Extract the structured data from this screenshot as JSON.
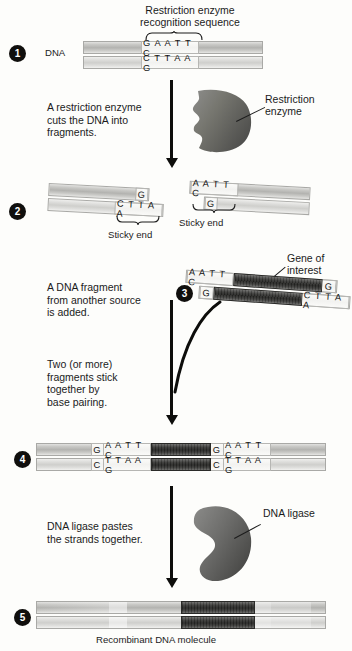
{
  "diagram": {
    "title_label": "Recombinant DNA molecule",
    "top_heading": "Restriction enzyme\nrecognition sequence"
  },
  "steps": [
    {
      "number": "1",
      "badge": "1"
    },
    {
      "number": "2",
      "badge": "2"
    },
    {
      "number": "3",
      "badge": "3"
    },
    {
      "number": "4",
      "badge": "4"
    },
    {
      "number": "5",
      "badge": "5"
    }
  ],
  "labels": {
    "dna": "DNA",
    "restriction_enzyme": "Restriction\nenzyme",
    "dna_ligase": "DNA ligase",
    "gene_of_interest": "Gene of\ninterest",
    "sticky_end_left": "Sticky end",
    "sticky_end_right": "Sticky end",
    "recombinant": "Recombinant DNA molecule"
  },
  "captions": {
    "step1": "A restriction enzyme\ncuts the DNA into\nfragments.",
    "step2": "A DNA fragment\nfrom another source\nis added.",
    "step3": "Two (or more)\nfragments stick\ntogether by\nbase pairing.",
    "step4": "DNA ligase pastes\nthe strands together."
  },
  "sequences": {
    "step1_top": "G A A T T C",
    "step1_bottom": "C T T A A G",
    "frag_left_top_end": "G",
    "frag_left_bottom_overhang": "C T T A A",
    "frag_right_top_overhang": "A A T T C",
    "frag_right_bottom_end": "G",
    "insert_top_left": "A A T T C",
    "insert_top_right": "G",
    "insert_bottom_left": "G",
    "insert_bottom_right": "C T T A A",
    "joined_top_1": "G",
    "joined_top_2": "A A T T  C",
    "joined_top_3": "G",
    "joined_top_4": "A A T T  C",
    "joined_bottom_1": "C",
    "joined_bottom_2": "T T A A  G",
    "joined_bottom_3": "C",
    "joined_bottom_4": "T T A A  G"
  },
  "colors": {
    "background": "#fdfdfb",
    "ink": "#1b1b1b",
    "badge": "#100f0d",
    "strand": "#b3b3b0",
    "gene_band": "#262624",
    "enzyme": "#6f6f6d"
  }
}
